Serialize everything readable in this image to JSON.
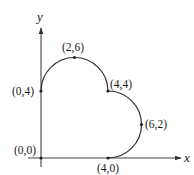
{
  "figure": {
    "type": "diagram",
    "axes": {
      "x_label": "x",
      "y_label": "y"
    },
    "points": [
      {
        "id": "origin",
        "label": "(0,0)",
        "x": 0,
        "y": 0
      },
      {
        "id": "p04",
        "label": "(0,4)",
        "x": 0,
        "y": 4
      },
      {
        "id": "p26",
        "label": "(2,6)",
        "x": 2,
        "y": 6
      },
      {
        "id": "p44",
        "label": "(4,4)",
        "x": 4,
        "y": 4
      },
      {
        "id": "p62",
        "label": "(6,2)",
        "x": 6,
        "y": 2
      },
      {
        "id": "p40",
        "label": "(4,0)",
        "x": 4,
        "y": 0
      }
    ],
    "curve_segments": [
      {
        "type": "semicircle",
        "from": "(0,4)",
        "through": "(2,6)",
        "to": "(4,4)",
        "center": [
          2,
          4
        ],
        "radius": 2
      },
      {
        "type": "semicircle",
        "from": "(4,4)",
        "through": "(6,2)",
        "to": "(4,0)",
        "center": [
          4,
          2
        ],
        "radius": 2
      },
      {
        "type": "line",
        "from": "(4,0)",
        "to": "(0,0)"
      },
      {
        "type": "line",
        "from": "(0,0)",
        "to": "(0,4)"
      }
    ],
    "colors": {
      "stroke": "#333333",
      "background": "#ffffff"
    }
  }
}
